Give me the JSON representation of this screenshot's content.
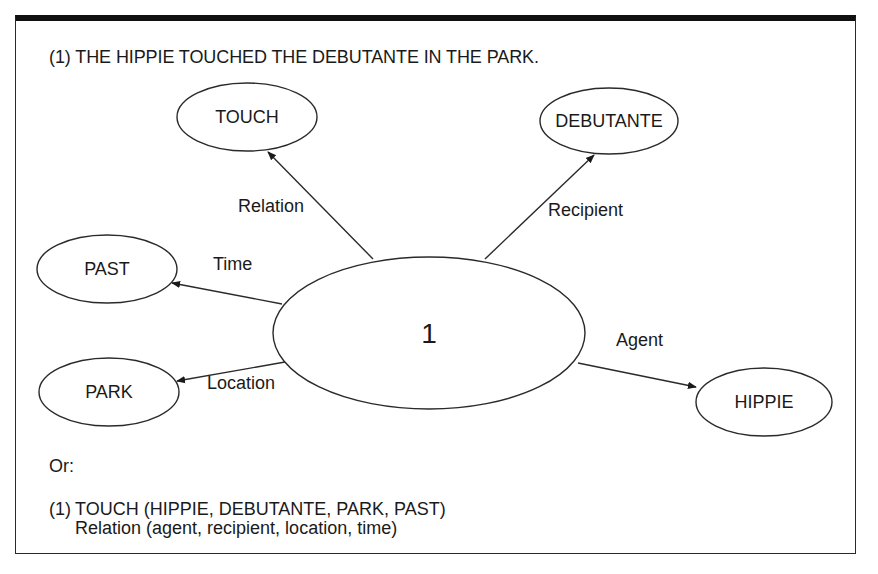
{
  "title": "(1)  THE HIPPIE TOUCHED THE DEBUTANTE IN THE PARK.",
  "diagram": {
    "center": {
      "label": "1",
      "cx": 429,
      "cy": 333,
      "rx": 156,
      "ry": 76
    },
    "nodes": [
      {
        "id": "touch",
        "label": "TOUCH",
        "cx": 247,
        "cy": 117,
        "rx": 70,
        "ry": 34
      },
      {
        "id": "debutante",
        "label": "DEBUTANTE",
        "cx": 609,
        "cy": 121,
        "rx": 69,
        "ry": 33
      },
      {
        "id": "past",
        "label": "PAST",
        "cx": 107,
        "cy": 269,
        "rx": 70,
        "ry": 34
      },
      {
        "id": "park",
        "label": "PARK",
        "cx": 109,
        "cy": 392,
        "rx": 70,
        "ry": 34
      },
      {
        "id": "hippie",
        "label": "HIPPIE",
        "cx": 764,
        "cy": 402,
        "rx": 68,
        "ry": 34
      }
    ],
    "edges": [
      {
        "label": "Relation",
        "from": "center",
        "to": "touch",
        "x1": 373,
        "y1": 259,
        "x2": 268,
        "y2": 152,
        "lx": 238,
        "ly": 212
      },
      {
        "label": "Recipient",
        "from": "center",
        "to": "debutante",
        "x1": 485,
        "y1": 259,
        "x2": 594,
        "y2": 155,
        "lx": 548,
        "ly": 216
      },
      {
        "label": "Time",
        "from": "center",
        "to": "past",
        "x1": 282,
        "y1": 304,
        "x2": 172,
        "y2": 283,
        "lx": 213,
        "ly": 270
      },
      {
        "label": "Location",
        "from": "center",
        "to": "park",
        "x1": 285,
        "y1": 362,
        "x2": 177,
        "y2": 381,
        "lx": 207,
        "ly": 389
      },
      {
        "label": "Agent",
        "from": "center",
        "to": "hippie",
        "x1": 578,
        "y1": 363,
        "x2": 696,
        "y2": 387,
        "lx": 616,
        "ly": 346
      }
    ]
  },
  "alternative": {
    "intro": "Or:",
    "number": "(1)",
    "formula": "TOUCH (HIPPIE, DEBUTANTE, PARK, PAST)",
    "roles": "Relation (agent, recipient, location, time)"
  }
}
